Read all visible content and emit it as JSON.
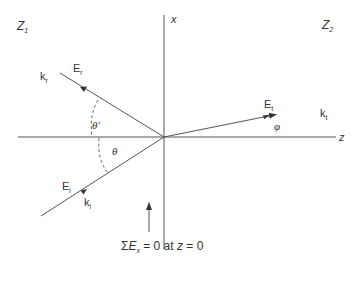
{
  "diagram": {
    "type": "wave reflection/refraction at boundary",
    "regions": {
      "left": {
        "label": "Z",
        "sub": "1"
      },
      "right": {
        "label": "Z",
        "sub": "2"
      }
    },
    "axes": {
      "vertical": "x",
      "horizontal": "z"
    },
    "rays": {
      "incident": {
        "field_label": "E",
        "field_sub": "i",
        "wave_label": "k",
        "wave_sub": "i"
      },
      "reflected": {
        "field_label": "E",
        "field_sub": "r",
        "wave_label": "k",
        "wave_sub": "r"
      },
      "transmitted": {
        "field_label": "E",
        "field_sub": "t",
        "wave_label": "k",
        "wave_sub": "t"
      }
    },
    "angles": {
      "incident": "θ",
      "reflected": "θ′",
      "transmitted": "φ"
    },
    "boundary_condition": {
      "sigma": "Σ",
      "E": "E",
      "E_sub": "x",
      "rest": " = 0 at ",
      "z": "z",
      "tail": " = 0"
    },
    "colors": {
      "line": "#555555",
      "text": "#333333",
      "background": "#ffffff"
    }
  }
}
